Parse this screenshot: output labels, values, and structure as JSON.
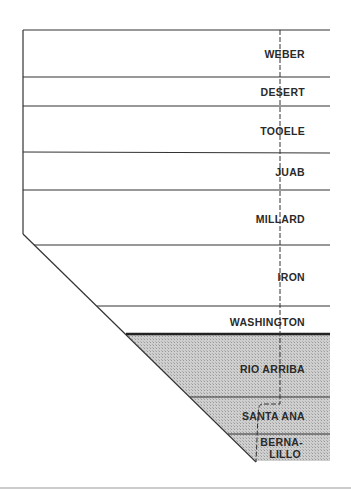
{
  "diagram": {
    "type": "stratigraphic-column-section",
    "colors": {
      "line": "#333333",
      "shade": "#c8c8c8",
      "label": "#2a2a2a",
      "bottom_rule": "#bdbdbd"
    },
    "units": [
      {
        "label": "WEBER",
        "shaded": false
      },
      {
        "label": "DESERT",
        "shaded": false
      },
      {
        "label": "TOOELE",
        "shaded": false
      },
      {
        "label": "JUAB",
        "shaded": false
      },
      {
        "label": "MILLARD",
        "shaded": false
      },
      {
        "label": "IRON",
        "shaded": false
      },
      {
        "label": "WASHINGTON",
        "shaded": false
      },
      {
        "label": "RIO ARRIBA",
        "shaded": true
      },
      {
        "label": "SANTA ANA",
        "shaded": true
      },
      {
        "label_line1": "BERNA-",
        "label_line2": "LILLO",
        "shaded": true
      }
    ]
  }
}
